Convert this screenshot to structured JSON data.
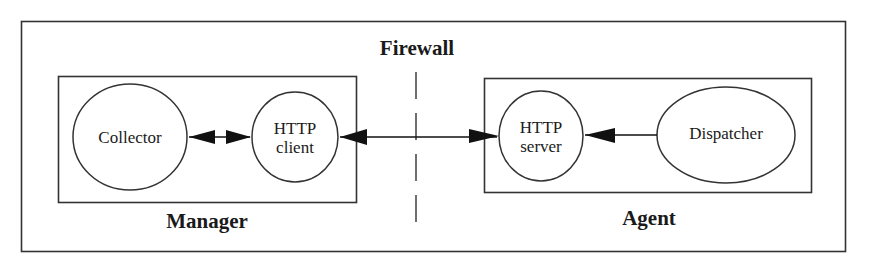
{
  "diagram": {
    "firewall_label": "Firewall",
    "manager": {
      "label": "Manager",
      "nodes": {
        "collector": "Collector",
        "http_client_line1": "HTTP",
        "http_client_line2": "client"
      }
    },
    "agent": {
      "label": "Agent",
      "nodes": {
        "http_server_line1": "HTTP",
        "http_server_line2": "server",
        "dispatcher": "Dispatcher"
      }
    },
    "edges": [
      {
        "from": "Collector",
        "to": "HTTP client",
        "type": "bidirectional"
      },
      {
        "from": "HTTP client",
        "to": "HTTP server",
        "type": "bidirectional",
        "crosses": "Firewall"
      },
      {
        "from": "Dispatcher",
        "to": "HTTP server",
        "type": "directed"
      }
    ]
  }
}
